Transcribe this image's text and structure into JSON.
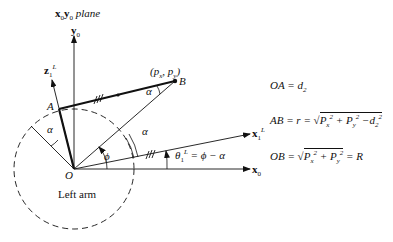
{
  "diagram": {
    "plane_label": {
      "axis_x": "x",
      "sub_x": "0",
      "axis_y": "y",
      "sub_y": "0",
      "word": "plane"
    },
    "axes": {
      "y0": {
        "name": "y",
        "sub": "0"
      },
      "x0": {
        "name": "x",
        "sub": "0"
      },
      "x1L": {
        "name": "x",
        "sub": "1",
        "sup": "L"
      },
      "z1L": {
        "name": "z",
        "sub": "1",
        "sup": "L"
      }
    },
    "points": {
      "O": "O",
      "A": "A",
      "B": "B",
      "B_coords": "(pₓ, pᵧ)",
      "B_px": "p",
      "B_px_sub": "x",
      "B_py": "p",
      "B_py_sub": "y"
    },
    "angles": {
      "alpha": "α",
      "phi": "ϕ",
      "theta_label": {
        "theta": "θ",
        "sub": "1",
        "sup": "L",
        "rhs": "= ϕ − α"
      }
    },
    "region_label": "Left arm",
    "equations": [
      {
        "id": "OA",
        "lhs": "OA",
        "rhs": "= d",
        "rhs_sub": "2"
      },
      {
        "id": "AB",
        "lhs": "AB = r =",
        "radicand": [
          "P",
          "x",
          "2",
          " + ",
          "P",
          "y",
          "2",
          " −d",
          "2",
          "2"
        ]
      },
      {
        "id": "OB",
        "lhs": "OB =",
        "radicand": [
          "P",
          "x",
          "2",
          " + ",
          "P",
          "y",
          "2"
        ],
        "tail": "= R"
      }
    ],
    "colors": {
      "ink": "#111111",
      "background": "#ffffff"
    }
  }
}
